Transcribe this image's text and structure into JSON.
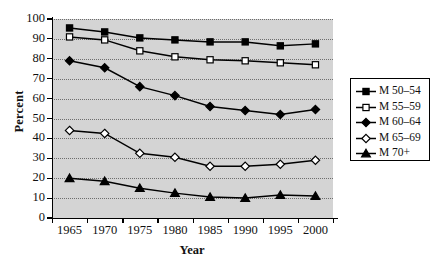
{
  "chart_data": {
    "type": "line",
    "title": "",
    "xlabel": "Year",
    "ylabel": "Percent",
    "x": [
      1965,
      1970,
      1975,
      1980,
      1985,
      1990,
      1995,
      2000
    ],
    "xticklabels": [
      "1965",
      "1970",
      "1975",
      "1980",
      "1985",
      "1990",
      "1995",
      "2000"
    ],
    "yticks": [
      0,
      10,
      20,
      30,
      40,
      50,
      60,
      70,
      80,
      90,
      100
    ],
    "yticklabels": [
      "0",
      "10",
      "20",
      "30",
      "40",
      "50",
      "60",
      "70",
      "80",
      "90",
      "100"
    ],
    "ylim": [
      0,
      100
    ],
    "xlim": [
      1962.5,
      2002.5
    ],
    "grid": true,
    "grid_style": "dotted-horizontal",
    "legend_position": "right-outside",
    "plot_background": "#d4d4d4",
    "series": [
      {
        "name": "M 50–54",
        "marker": "filled-square",
        "color": "#000000",
        "values": [
          95.5,
          93.5,
          90.5,
          89.5,
          88.5,
          88.5,
          86.5,
          87.5
        ]
      },
      {
        "name": "M 55–59",
        "marker": "open-square",
        "color": "#000000",
        "values": [
          91.0,
          89.5,
          84.0,
          81.0,
          79.5,
          79.0,
          78.0,
          77.0
        ]
      },
      {
        "name": "M 60–64",
        "marker": "filled-diamond",
        "color": "#000000",
        "values": [
          79.0,
          75.5,
          66.0,
          61.5,
          56.0,
          54.0,
          52.0,
          54.5
        ]
      },
      {
        "name": "M 65–69",
        "marker": "open-diamond",
        "color": "#000000",
        "values": [
          44.0,
          42.5,
          32.5,
          30.5,
          26.0,
          26.0,
          27.0,
          29.0
        ]
      },
      {
        "name": "M 70+",
        "marker": "filled-triangle",
        "color": "#000000",
        "values": [
          20.0,
          18.5,
          15.0,
          12.5,
          10.5,
          10.0,
          11.5,
          11.0
        ]
      }
    ]
  },
  "legend": {
    "items": [
      {
        "label": "M 50–54",
        "marker": "filled-square"
      },
      {
        "label": "M 55–59",
        "marker": "open-square"
      },
      {
        "label": "M 60–64",
        "marker": "filled-diamond"
      },
      {
        "label": "M 65–69",
        "marker": "open-diamond"
      },
      {
        "label": "M 70+",
        "marker": "filled-triangle"
      }
    ]
  }
}
